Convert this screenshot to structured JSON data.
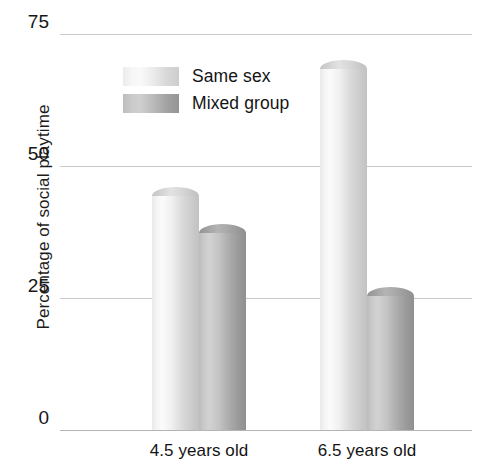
{
  "chart_data": {
    "type": "bar",
    "title": "",
    "subtitle": "",
    "xlabel": "",
    "ylabel": "Percentage of social playtime",
    "categories": [
      "4.5 years old",
      "6.5 years old"
    ],
    "series": [
      {
        "name": "Same sex",
        "values": [
          46,
          70
        ]
      },
      {
        "name": "Mixed group",
        "values": [
          39,
          27
        ]
      }
    ],
    "ylim": [
      0,
      75
    ],
    "yticks": [
      0,
      25,
      50,
      75
    ],
    "ytick_labels": [
      "0",
      "25",
      "50",
      "75"
    ],
    "grid": true,
    "grid_axis": "y",
    "legend_position": "upper-center-left",
    "style": "3d-cylinder-grayscale",
    "colors": {
      "series_same_sex": "#e8e8e8",
      "series_mixed_group": "#b5b5b5",
      "gridline": "#c9c9c9",
      "baseline": "#b4b4b4",
      "text": "#141414",
      "background": "#ffffff"
    }
  },
  "axis": {
    "y_title": "Percentage of social playtime",
    "y_tick_0": "0",
    "y_tick_25": "25",
    "y_tick_50": "50",
    "y_tick_75": "75",
    "x_tick_0": "4.5 years old",
    "x_tick_1": "6.5 years old"
  },
  "legend": {
    "items": [
      {
        "label": "Same sex"
      },
      {
        "label": "Mixed group"
      }
    ]
  }
}
